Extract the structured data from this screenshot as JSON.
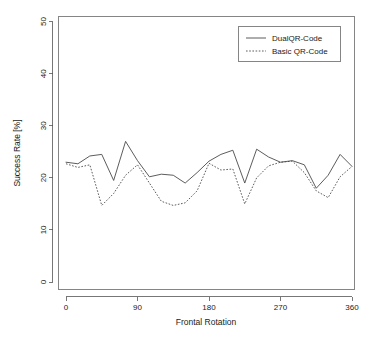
{
  "chart_data": {
    "type": "line",
    "title": "",
    "xlabel": "Frontal Rotation",
    "ylabel": "Success Rate [%]",
    "xlim": [
      0,
      360
    ],
    "ylim": [
      0,
      52
    ],
    "grid": false,
    "legend_position": "top-right",
    "x_ticks": [
      "0",
      "90",
      "180",
      "270",
      "360"
    ],
    "x_tick_values": [
      0,
      90,
      180,
      270,
      360
    ],
    "y_ticks": [
      "0",
      "10",
      "20",
      "30",
      "40",
      "50"
    ],
    "y_tick_values": [
      0,
      10,
      20,
      30,
      40,
      50
    ],
    "x": [
      0,
      15,
      30,
      45,
      60,
      75,
      90,
      105,
      120,
      135,
      150,
      165,
      180,
      195,
      210,
      225,
      240,
      255,
      270,
      285,
      300,
      315,
      330,
      345,
      360
    ],
    "series": [
      {
        "name": "DualQR-Code",
        "style": "solid",
        "color": "#4a4a4a",
        "values": [
          23.0,
          22.7,
          24.2,
          24.5,
          19.5,
          27.0,
          23.3,
          20.2,
          20.7,
          20.5,
          19.0,
          21.0,
          23.2,
          24.5,
          25.3,
          19.0,
          25.5,
          24.0,
          23.0,
          23.3,
          22.5,
          18.0,
          20.5,
          24.5,
          22.2
        ]
      },
      {
        "name": "Basic QR-Code",
        "style": "dotted",
        "color": "#4a4a4a",
        "values": [
          22.7,
          22.0,
          22.5,
          14.7,
          17.0,
          20.5,
          22.5,
          19.0,
          15.5,
          14.7,
          15.2,
          17.5,
          22.8,
          21.5,
          21.7,
          15.0,
          20.0,
          22.3,
          23.0,
          23.2,
          21.0,
          17.5,
          16.2,
          20.2,
          22.2
        ]
      }
    ]
  },
  "legend": {
    "entries": [
      {
        "label": "DualQR-Code"
      },
      {
        "label": "Basic QR-Code"
      }
    ]
  },
  "axes": {
    "x_title": "Frontal Rotation",
    "y_title": "Success Rate [%]"
  }
}
